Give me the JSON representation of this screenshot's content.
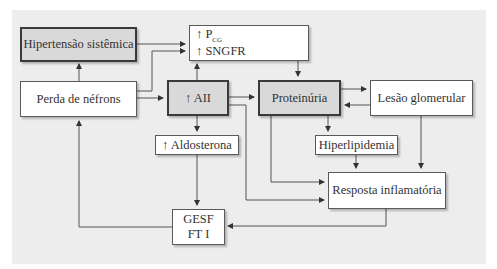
{
  "diagram": {
    "nodes": {
      "hipertensao": {
        "label": "Hipertensão sistêmica",
        "style": "highlighted"
      },
      "pcg_sngfr": {
        "line1_arrow": "↑",
        "line1_main": "P",
        "line1_sub": "CG",
        "line2": "↑ SNGFR",
        "style": "plain"
      },
      "perda_nefrons": {
        "label": "Perda de néfrons",
        "style": "plain"
      },
      "aii": {
        "label": "↑ AII",
        "style": "highlighted"
      },
      "proteinuria": {
        "label": "Proteinúria",
        "style": "highlighted"
      },
      "lesao_glomerular": {
        "label": "Lesão glomerular",
        "style": "plain"
      },
      "aldosterona": {
        "label": "↑ Aldosterona",
        "style": "plain"
      },
      "hiperlipidemia": {
        "label": "Hiperlipidemia",
        "style": "plain"
      },
      "resposta_inflamatoria": {
        "label": "Resposta inflamatória",
        "style": "plain"
      },
      "gesf_fti": {
        "line1": "GESF",
        "line2": "FT I",
        "style": "plain"
      }
    },
    "edges": [
      {
        "from": "perda_nefrons",
        "to": "hipertensao"
      },
      {
        "from": "hipertensao",
        "to": "pcg_sngfr"
      },
      {
        "from": "perda_nefrons",
        "to": "pcg_sngfr"
      },
      {
        "from": "perda_nefrons",
        "to": "aii"
      },
      {
        "from": "aii",
        "to": "pcg_sngfr"
      },
      {
        "from": "aii",
        "to": "proteinuria"
      },
      {
        "from": "aii",
        "to": "aldosterona"
      },
      {
        "from": "aii",
        "to": "resposta_inflamatoria"
      },
      {
        "from": "pcg_sngfr",
        "to": "proteinuria"
      },
      {
        "from": "proteinuria",
        "to": "lesao_glomerular"
      },
      {
        "from": "lesao_glomerular",
        "to": "proteinuria"
      },
      {
        "from": "proteinuria",
        "to": "hiperlipidemia"
      },
      {
        "from": "proteinuria",
        "to": "resposta_inflamatoria"
      },
      {
        "from": "hiperlipidemia",
        "to": "resposta_inflamatoria"
      },
      {
        "from": "lesao_glomerular",
        "to": "resposta_inflamatoria"
      },
      {
        "from": "aldosterona",
        "to": "gesf_fti"
      },
      {
        "from": "resposta_inflamatoria",
        "to": "gesf_fti"
      },
      {
        "from": "gesf_fti",
        "to": "perda_nefrons"
      }
    ],
    "colors": {
      "background": "#ededed",
      "highlight_fill": "#d9d9d9",
      "plain_fill": "#ffffff",
      "line": "#555555"
    }
  }
}
